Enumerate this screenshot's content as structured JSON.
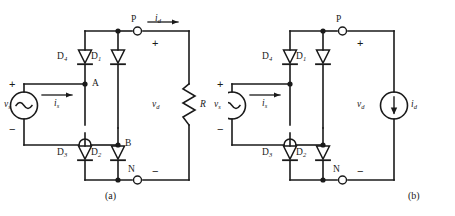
{
  "figure": {
    "type": "circuit-diagram",
    "colors": {
      "wire": "#1a1a1a",
      "background": "#ffffff",
      "text": "#1a1a1a"
    }
  },
  "circuits": [
    {
      "id": "a",
      "caption": "(a)",
      "source": {
        "symbol": "ac-voltage-source",
        "label": "v",
        "label_sub": "s",
        "plus": "+",
        "minus": "−",
        "current_label": "i",
        "current_sub": "s",
        "current_direction": "right"
      },
      "diodes": [
        {
          "name": "D",
          "sub": "4",
          "position": "top-left"
        },
        {
          "name": "D",
          "sub": "1",
          "position": "top-right"
        },
        {
          "name": "D",
          "sub": "3",
          "position": "bottom-left"
        },
        {
          "name": "D",
          "sub": "2",
          "position": "bottom-right"
        }
      ],
      "nodes": [
        {
          "label": "A",
          "type": "junction"
        },
        {
          "label": "B",
          "type": "junction"
        },
        {
          "label": "P",
          "type": "terminal"
        },
        {
          "label": "N",
          "type": "terminal"
        }
      ],
      "output": {
        "current_label": "i",
        "current_sub": "d",
        "current_direction": "right",
        "voltage_label": "v",
        "voltage_sub": "d",
        "plus": "+",
        "minus": "−"
      },
      "load": {
        "symbol": "resistor",
        "label": "R"
      }
    },
    {
      "id": "b",
      "caption": "(b)",
      "source": {
        "symbol": "ac-voltage-source",
        "label": "v",
        "label_sub": "s",
        "plus": "+",
        "minus": "−",
        "current_label": "i",
        "current_sub": "s",
        "current_direction": "right"
      },
      "diodes": [
        {
          "name": "D",
          "sub": "4",
          "position": "top-left"
        },
        {
          "name": "D",
          "sub": "1",
          "position": "top-right"
        },
        {
          "name": "D",
          "sub": "3",
          "position": "bottom-left"
        },
        {
          "name": "D",
          "sub": "2",
          "position": "bottom-right"
        }
      ],
      "nodes": [
        {
          "label": "P",
          "type": "terminal"
        },
        {
          "label": "N",
          "type": "terminal"
        }
      ],
      "output": {
        "voltage_label": "v",
        "voltage_sub": "d",
        "plus": "+",
        "minus": "−"
      },
      "load": {
        "symbol": "current-source",
        "label": "i",
        "label_sub": "d"
      }
    }
  ]
}
